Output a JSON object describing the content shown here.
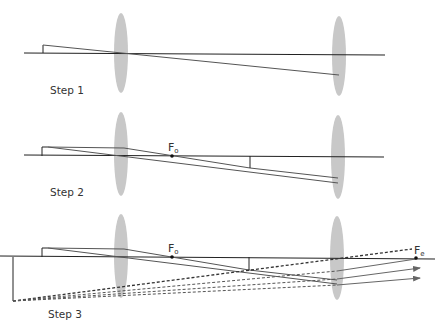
{
  "figure": {
    "steps": [
      {
        "label": "Step 1",
        "axis_y": 53,
        "objective_lens_x": 121,
        "eyepiece_lens_x": 339,
        "object": {
          "x": 43,
          "base_y": 53,
          "tip_y": 45
        },
        "focal_points": []
      },
      {
        "label": "Step 2",
        "axis_y": 156,
        "objective_lens_x": 121,
        "eyepiece_lens_x": 338,
        "object": {
          "x": 42,
          "base_y": 156,
          "tip_y": 147
        },
        "focal_points": [
          {
            "label": "F",
            "subscript": "o",
            "x": 172
          }
        ],
        "intermediate_image": {
          "x": 250,
          "base_y": 156,
          "tip_y": 168
        }
      },
      {
        "label": "Step 3",
        "axis_y": 257,
        "objective_lens_x": 121,
        "eyepiece_lens_x": 337,
        "object": {
          "x": 42,
          "base_y": 257,
          "tip_y": 248
        },
        "focal_points": [
          {
            "label": "F",
            "subscript": "o",
            "x": 172
          },
          {
            "label": "F",
            "subscript": "e",
            "x": 416
          }
        ],
        "intermediate_image": {
          "x": 249,
          "base_y": 257,
          "tip_y": 270
        },
        "virtual_image": {
          "x": 13,
          "base_y": 257,
          "tip_y": 301
        }
      }
    ],
    "colors": {
      "lens": "#c8c8c8",
      "axis": "#222222",
      "ray": "#555555",
      "dashed": "#333333",
      "background": "#ffffff"
    }
  }
}
